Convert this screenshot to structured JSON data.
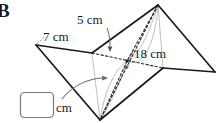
{
  "problem": {
    "letter": "B"
  },
  "figure": {
    "name": "star-bipyramid-solid",
    "labels": {
      "edge_top": "5 cm",
      "edge_left": "7 cm",
      "diagonal": "18 cm",
      "center_point": "o"
    },
    "colors": {
      "solid_line": "#1a1a1a",
      "hidden_line": "#2b2b2b",
      "faint_line": "#b9b9b9",
      "arrow": "#6e6e6e",
      "answer_box_border": "#777777",
      "background": "#ffffff"
    }
  },
  "answer": {
    "value": "",
    "placeholder": "",
    "unit": "cm"
  }
}
